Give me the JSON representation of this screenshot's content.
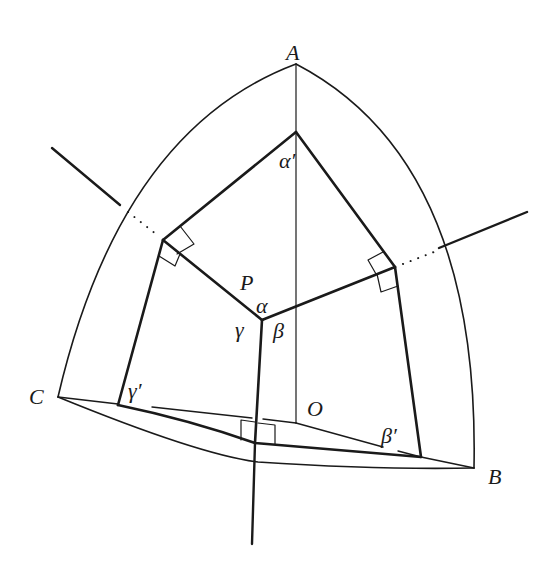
{
  "diagram": {
    "type": "spherical-geometry",
    "labels": {
      "A": "A",
      "B": "B",
      "C": "C",
      "O": "O",
      "P": "P",
      "alpha": "α",
      "beta": "β",
      "gamma": "γ",
      "alpha_prime": "α′",
      "beta_prime": "β′",
      "gamma_prime": "γ′"
    },
    "colors": {
      "stroke": "#1a1a1a",
      "background": "#ffffff"
    }
  }
}
